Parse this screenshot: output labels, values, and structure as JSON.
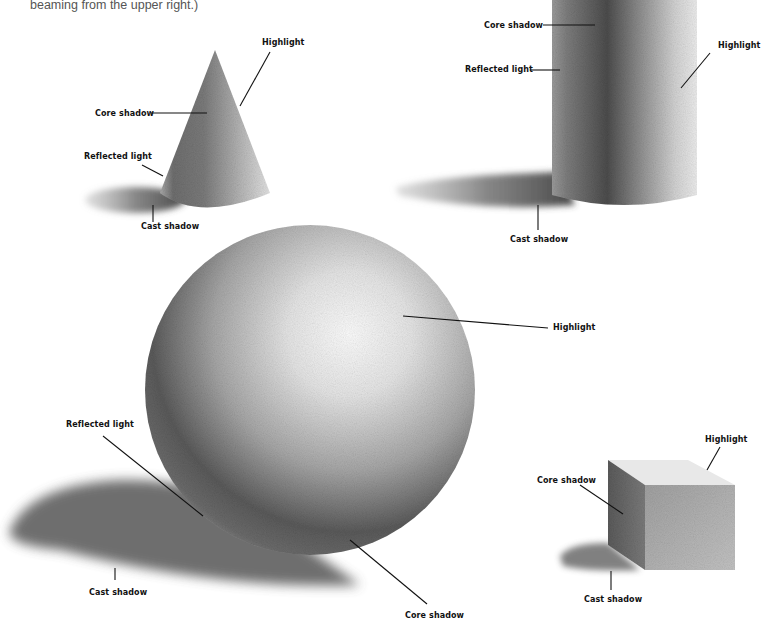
{
  "caption": "beaming from the upper right.)",
  "figures": {
    "cone": {
      "labels": {
        "highlight": "Highlight",
        "core_shadow": "Core shadow",
        "reflected_light": "Reflected light",
        "cast_shadow": "Cast shadow"
      }
    },
    "cylinder": {
      "labels": {
        "core_shadow": "Core shadow",
        "reflected_light": "Reflected light",
        "highlight": "Highlight",
        "cast_shadow": "Cast shadow"
      }
    },
    "sphere": {
      "labels": {
        "highlight": "Highlight",
        "reflected_light": "Reflected light",
        "cast_shadow": "Cast shadow",
        "core_shadow": "Core shadow"
      }
    },
    "cube": {
      "labels": {
        "highlight": "Highlight",
        "core_shadow": "Core shadow",
        "cast_shadow": "Cast shadow"
      }
    }
  },
  "colors": {
    "paper": "#ffffff",
    "graphite_dark": "#3a3a3a",
    "graphite_mid": "#8a8a8a",
    "graphite_light": "#e6e6e6",
    "text": "#111111",
    "caption": "#555555"
  }
}
